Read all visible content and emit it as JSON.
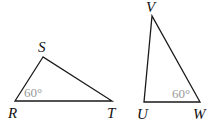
{
  "triangles": [
    {
      "name": "RST",
      "vertices": {
        "S": "S",
        "R": "R",
        "T": "T"
      },
      "angle_label": "60°",
      "angle_at": "R"
    },
    {
      "name": "UVW",
      "vertices": {
        "V": "V",
        "U": "U",
        "W": "W"
      },
      "angle_label": "60°",
      "angle_at": "W"
    }
  ],
  "colors": {
    "stroke": "#1a1a1a",
    "angle_text": "#999999"
  }
}
